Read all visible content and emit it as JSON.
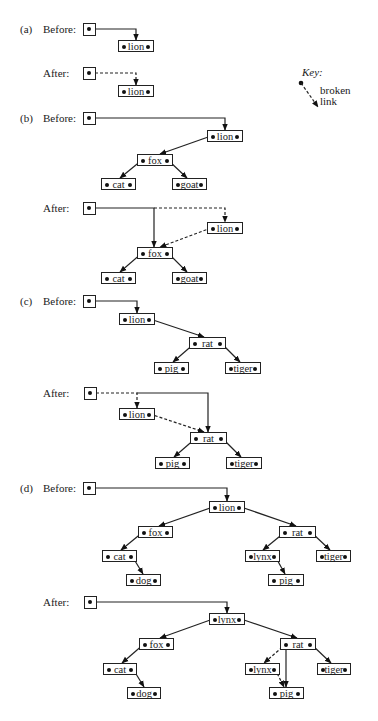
{
  "key": {
    "title": "Key:",
    "line1": "broken",
    "line2": "link"
  },
  "panels": [
    {
      "tag": "(a)",
      "before": {
        "label": "Before:",
        "root": {
          "x": 83,
          "y": 23
        },
        "nodes": [
          {
            "id": "lion",
            "name": "lion",
            "x": 118,
            "y": 40,
            "w": 36
          }
        ],
        "edges": [
          {
            "path": [
              [
                90,
                29
              ],
              [
                136,
                29
              ],
              [
                136,
                40
              ]
            ],
            "style": "solid"
          }
        ]
      },
      "after": {
        "label": "After:",
        "root": {
          "x": 83,
          "y": 67
        },
        "nodes": [
          {
            "id": "lion",
            "name": "lion",
            "x": 118,
            "y": 85,
            "w": 36
          }
        ],
        "edges": [
          {
            "path": [
              [
                90,
                73
              ],
              [
                136,
                73
              ],
              [
                136,
                85
              ]
            ],
            "style": "dashed"
          }
        ]
      }
    },
    {
      "tag": "(b)",
      "before": {
        "label": "Before:",
        "root": {
          "x": 83,
          "y": 112
        },
        "nodes": [
          {
            "id": "lion",
            "name": "lion",
            "x": 207,
            "y": 130,
            "w": 36
          },
          {
            "id": "fox",
            "name": "fox",
            "x": 137,
            "y": 154,
            "w": 36
          },
          {
            "id": "cat",
            "name": "cat",
            "x": 101,
            "y": 178,
            "w": 35
          },
          {
            "id": "goat",
            "name": "goat",
            "x": 172,
            "y": 178,
            "w": 35
          }
        ],
        "edges": [
          {
            "path": [
              [
                90,
                118
              ],
              [
                225,
                118
              ],
              [
                225,
                130
              ]
            ],
            "style": "solid"
          },
          {
            "path": [
              [
                211,
                136
              ],
              [
                160,
                154
              ]
            ],
            "style": "solid"
          },
          {
            "path": [
              [
                142,
                160
              ],
              [
                120,
                178
              ]
            ],
            "style": "solid"
          },
          {
            "path": [
              [
                168,
                160
              ],
              [
                187,
                178
              ]
            ],
            "style": "solid"
          }
        ]
      },
      "after": {
        "label": "After:",
        "root": {
          "x": 83,
          "y": 202
        },
        "nodes": [
          {
            "id": "lion",
            "name": "lion",
            "x": 207,
            "y": 222,
            "w": 36
          },
          {
            "id": "fox",
            "name": "fox",
            "x": 137,
            "y": 247,
            "w": 36
          },
          {
            "id": "cat",
            "name": "cat",
            "x": 101,
            "y": 272,
            "w": 35
          },
          {
            "id": "goat",
            "name": "goat",
            "x": 172,
            "y": 272,
            "w": 35
          }
        ],
        "edges": [
          {
            "path": [
              [
                90,
                208
              ],
              [
                154,
                208
              ],
              [
                154,
                247
              ]
            ],
            "style": "solid"
          },
          {
            "path": [
              [
                154,
                208
              ],
              [
                225,
                208
              ],
              [
                225,
                222
              ]
            ],
            "style": "dashed"
          },
          {
            "path": [
              [
                211,
                228
              ],
              [
                160,
                247
              ]
            ],
            "style": "dashed"
          },
          {
            "path": [
              [
                142,
                253
              ],
              [
                120,
                272
              ]
            ],
            "style": "solid"
          },
          {
            "path": [
              [
                168,
                253
              ],
              [
                187,
                272
              ]
            ],
            "style": "solid"
          }
        ]
      }
    },
    {
      "tag": "(c)",
      "before": {
        "label": "Before:",
        "root": {
          "x": 83,
          "y": 295
        },
        "nodes": [
          {
            "id": "lion",
            "name": "lion",
            "x": 119,
            "y": 313,
            "w": 36
          },
          {
            "id": "rat",
            "name": "rat",
            "x": 189,
            "y": 337,
            "w": 37
          },
          {
            "id": "pig",
            "name": "pig",
            "x": 154,
            "y": 362,
            "w": 35
          },
          {
            "id": "tiger",
            "name": "tiger",
            "x": 225,
            "y": 362,
            "w": 36
          }
        ],
        "edges": [
          {
            "path": [
              [
                90,
                301
              ],
              [
                137,
                301
              ],
              [
                137,
                313
              ]
            ],
            "style": "solid"
          },
          {
            "path": [
              [
                150,
                319
              ],
              [
                204,
                337
              ]
            ],
            "style": "solid"
          },
          {
            "path": [
              [
                195,
                343
              ],
              [
                173,
                362
              ]
            ],
            "style": "solid"
          },
          {
            "path": [
              [
                221,
                343
              ],
              [
                240,
                362
              ]
            ],
            "style": "solid"
          }
        ]
      },
      "after": {
        "label": "After:",
        "root": {
          "x": 84,
          "y": 387
        },
        "nodes": [
          {
            "id": "lion",
            "name": "lion",
            "x": 119,
            "y": 408,
            "w": 36
          },
          {
            "id": "rat",
            "name": "rat",
            "x": 190,
            "y": 432,
            "w": 37
          },
          {
            "id": "pig",
            "name": "pig",
            "x": 155,
            "y": 457,
            "w": 35
          },
          {
            "id": "tiger",
            "name": "tiger",
            "x": 226,
            "y": 457,
            "w": 36
          }
        ],
        "edges": [
          {
            "path": [
              [
                91,
                393
              ],
              [
                137,
                393
              ],
              [
                137,
                408
              ]
            ],
            "style": "dashed"
          },
          {
            "path": [
              [
                137,
                393
              ],
              [
                208,
                393
              ],
              [
                208,
                432
              ]
            ],
            "style": "solid"
          },
          {
            "path": [
              [
                150,
                414
              ],
              [
                204,
                432
              ]
            ],
            "style": "dashed"
          },
          {
            "path": [
              [
                196,
                438
              ],
              [
                174,
                457
              ]
            ],
            "style": "solid"
          },
          {
            "path": [
              [
                222,
                438
              ],
              [
                241,
                457
              ]
            ],
            "style": "solid"
          }
        ]
      }
    },
    {
      "tag": "(d)",
      "before": {
        "label": "Before:",
        "root": {
          "x": 83,
          "y": 482
        },
        "nodes": [
          {
            "id": "lion",
            "name": "lion",
            "x": 209,
            "y": 501,
            "w": 36
          },
          {
            "id": "fox",
            "name": "fox",
            "x": 138,
            "y": 526,
            "w": 35
          },
          {
            "id": "rat",
            "name": "rat",
            "x": 279,
            "y": 526,
            "w": 37
          },
          {
            "id": "cat",
            "name": "cat",
            "x": 102,
            "y": 550,
            "w": 35
          },
          {
            "id": "lynx",
            "name": "lynx",
            "x": 245,
            "y": 550,
            "w": 35
          },
          {
            "id": "tiger",
            "name": "tiger",
            "x": 316,
            "y": 550,
            "w": 35
          },
          {
            "id": "dog",
            "name": "dog",
            "x": 126,
            "y": 574,
            "w": 35
          },
          {
            "id": "pig",
            "name": "pig",
            "x": 268,
            "y": 574,
            "w": 36
          }
        ],
        "edges": [
          {
            "path": [
              [
                90,
                488
              ],
              [
                227,
                488
              ],
              [
                227,
                501
              ]
            ],
            "style": "solid"
          },
          {
            "path": [
              [
                213,
                507
              ],
              [
                159,
                526
              ]
            ],
            "style": "solid"
          },
          {
            "path": [
              [
                241,
                507
              ],
              [
                296,
                526
              ]
            ],
            "style": "solid"
          },
          {
            "path": [
              [
                143,
                532
              ],
              [
                121,
                550
              ]
            ],
            "style": "solid"
          },
          {
            "path": [
              [
                285,
                532
              ],
              [
                263,
                550
              ]
            ],
            "style": "solid"
          },
          {
            "path": [
              [
                311,
                532
              ],
              [
                330,
                550
              ]
            ],
            "style": "solid"
          },
          {
            "path": [
              [
                132,
                556
              ],
              [
                143,
                574
              ]
            ],
            "style": "solid"
          },
          {
            "path": [
              [
                275,
                556
              ],
              [
                285,
                574
              ]
            ],
            "style": "solid"
          }
        ]
      },
      "after": {
        "label": "After:",
        "root": {
          "x": 84,
          "y": 596
        },
        "nodes": [
          {
            "id": "lynx-root",
            "name": "lynx",
            "x": 209,
            "y": 613,
            "w": 36
          },
          {
            "id": "fox",
            "name": "fox",
            "x": 139,
            "y": 638,
            "w": 35
          },
          {
            "id": "rat",
            "name": "rat",
            "x": 280,
            "y": 638,
            "w": 36
          },
          {
            "id": "cat",
            "name": "cat",
            "x": 103,
            "y": 663,
            "w": 34
          },
          {
            "id": "lynx",
            "name": "lynx",
            "x": 245,
            "y": 663,
            "w": 35
          },
          {
            "id": "tiger",
            "name": "tiger",
            "x": 317,
            "y": 663,
            "w": 34
          },
          {
            "id": "dog",
            "name": "dog",
            "x": 127,
            "y": 687,
            "w": 34
          },
          {
            "id": "pig",
            "name": "pig",
            "x": 269,
            "y": 687,
            "w": 35
          }
        ],
        "edges": [
          {
            "path": [
              [
                91,
                602
              ],
              [
                227,
                602
              ],
              [
                227,
                613
              ]
            ],
            "style": "solid"
          },
          {
            "path": [
              [
                213,
                619
              ],
              [
                160,
                638
              ]
            ],
            "style": "solid"
          },
          {
            "path": [
              [
                241,
                619
              ],
              [
                297,
                638
              ]
            ],
            "style": "solid"
          },
          {
            "path": [
              [
                144,
                644
              ],
              [
                122,
                663
              ]
            ],
            "style": "solid"
          },
          {
            "path": [
              [
                286,
                644
              ],
              [
                286,
                687
              ]
            ],
            "style": "solid"
          },
          {
            "path": [
              [
                286,
                644
              ],
              [
                264,
                663
              ]
            ],
            "style": "dashed"
          },
          {
            "path": [
              [
                311,
                644
              ],
              [
                331,
                663
              ]
            ],
            "style": "solid"
          },
          {
            "path": [
              [
                133,
                669
              ],
              [
                144,
                687
              ]
            ],
            "style": "solid"
          },
          {
            "path": [
              [
                275,
                669
              ],
              [
                284,
                687
              ]
            ],
            "style": "dashed"
          }
        ]
      }
    }
  ]
}
